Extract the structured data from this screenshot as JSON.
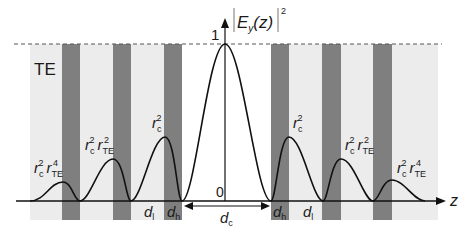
{
  "diagram": {
    "mode_label": "TE",
    "y_axis_label": {
      "main": "E",
      "sub": "y",
      "arg": "(z)",
      "power": "2"
    },
    "y_axis_max_tick": "1",
    "origin_label": "0",
    "x_axis_label": "z",
    "peak_labels": {
      "r_c2": {
        "base": "r",
        "sub": "c",
        "sup": "2"
      },
      "r_c2_rte2": {
        "base1": "r",
        "sub1": "c",
        "sup1": "2",
        "base2": "r",
        "sub2": "TE",
        "sup2": "2"
      },
      "r_c2_rte4": {
        "base1": "r",
        "sub1": "c",
        "sup1": "2",
        "base2": "r",
        "sub2": "TE",
        "sup2": "4"
      }
    },
    "dimension_labels": {
      "d_l": {
        "base": "d",
        "sub": "l"
      },
      "d_h": {
        "base": "d",
        "sub": "h"
      },
      "d_c": {
        "base": "d",
        "sub": "c"
      }
    },
    "colors": {
      "high_index_layer": "#7f7f7f",
      "low_index_layer": "#ececec",
      "curve": "#111111",
      "dashed_line": "#555555"
    }
  }
}
